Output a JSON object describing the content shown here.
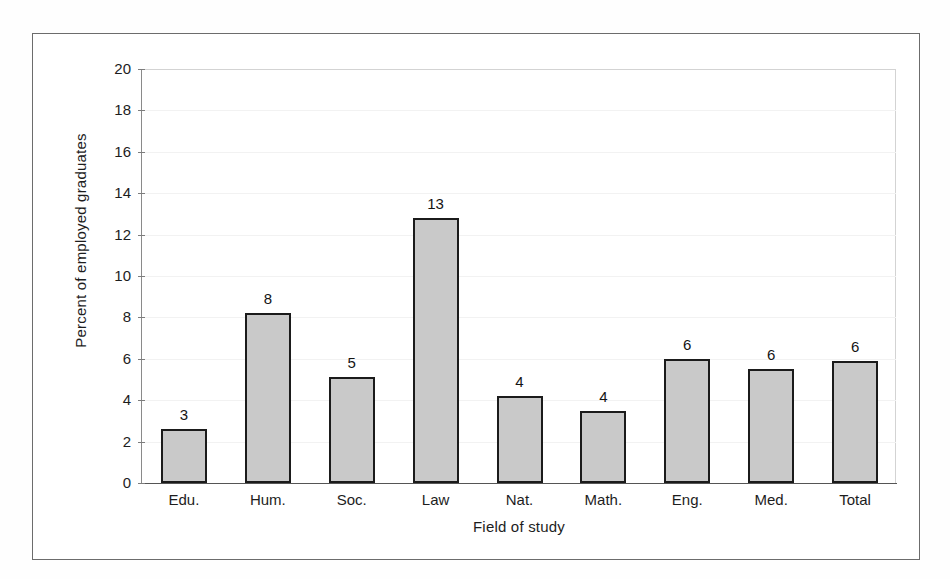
{
  "figure": {
    "frame_color": "#6c6c6c",
    "background": "#ffffff"
  },
  "chart_data": {
    "type": "bar",
    "title": "",
    "subtitle": "",
    "xlabel": "Field of study",
    "ylabel": "Percent of employed graduates",
    "categories": [
      "Edu.",
      "Hum.",
      "Soc.",
      "Law",
      "Nat.",
      "Math.",
      "Eng.",
      "Med.",
      "Total"
    ],
    "values": [
      2.6,
      8.2,
      5.1,
      12.8,
      4.2,
      3.5,
      6.0,
      5.5,
      5.9
    ],
    "data_labels": [
      "3",
      "8",
      "5",
      "13",
      "4",
      "4",
      "6",
      "6",
      "6"
    ],
    "series": [
      {
        "name": "Percent of employed graduates",
        "values": [
          2.6,
          8.2,
          5.1,
          12.8,
          4.2,
          3.5,
          6.0,
          5.5,
          5.9
        ]
      }
    ],
    "ylim": [
      0,
      20
    ],
    "ytick_step": 2,
    "ytick_labels": [
      "0",
      "2",
      "4",
      "6",
      "8",
      "10",
      "12",
      "14",
      "16",
      "18",
      "20"
    ],
    "ytick_values": [
      0,
      2,
      4,
      6,
      8,
      10,
      12,
      14,
      16,
      18,
      20
    ],
    "xlim_note": "categorical",
    "grid": "faint-horizontal",
    "legend": "none",
    "legend_position": "none",
    "bar_fill_color": "#c9c9c9",
    "bar_border_color": "#1b1b1b",
    "axis_color": "#7d7d7d",
    "text_color": "#1d1d1d"
  }
}
